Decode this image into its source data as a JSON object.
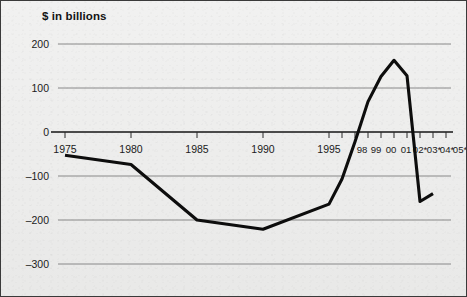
{
  "chart_data": {
    "type": "line",
    "title": "$ in billions",
    "xlabel": "",
    "ylabel": "",
    "ylim": [
      -300,
      200
    ],
    "yticks": [
      200,
      100,
      0,
      -100,
      -200,
      -300
    ],
    "ytick_labels": [
      "200",
      "100",
      "0",
      "–100",
      "–200",
      "–300"
    ],
    "grid": true,
    "legend": "none",
    "x": [
      1975,
      1980,
      1985,
      1990,
      1995,
      1996,
      1997,
      1998,
      1999,
      2000,
      2001,
      2002,
      2003
    ],
    "xtick_values": [
      1975,
      1980,
      1985,
      1990,
      1995,
      1996,
      1997,
      1998,
      1999,
      2000,
      2001,
      2002,
      2003,
      2004,
      2005
    ],
    "xtick_labels": [
      "1975",
      "1980",
      "1985",
      "1990",
      "1995",
      "",
      "",
      "98",
      "99",
      "00",
      "01",
      "02*",
      "03*",
      "04*",
      "05*"
    ],
    "values": [
      -53,
      -74,
      -200,
      -221,
      -164,
      -107,
      -22,
      69,
      126,
      163,
      128,
      -158,
      -140
    ],
    "series": [
      {
        "name": "Federal budget surplus/deficit",
        "values": [
          -53,
          -74,
          -200,
          -221,
          -164,
          -107,
          -22,
          69,
          126,
          163,
          128,
          -158,
          -140
        ]
      }
    ],
    "annotations": []
  },
  "axis": {
    "y_label_0": "200",
    "y_label_1": "100",
    "y_label_2": "0",
    "y_label_3": "–100",
    "y_label_4": "–200",
    "y_label_5": "–300",
    "x_label_0": "1975",
    "x_label_1": "1980",
    "x_label_2": "1985",
    "x_label_3": "1990",
    "x_label_4": "1995",
    "x_label_5": "98",
    "x_label_6": "99",
    "x_label_7": "00",
    "x_label_8": "01",
    "x_label_9": "02*",
    "x_label_10": "03*",
    "x_label_11": "04*",
    "x_label_12": "05*"
  },
  "colors": {
    "background": "#ececeb",
    "border": "#3a3a3a",
    "line": "#0d0d0d",
    "gridline": "#6e6e6e",
    "zeroline": "#141414",
    "text": "#1b1b1b"
  }
}
